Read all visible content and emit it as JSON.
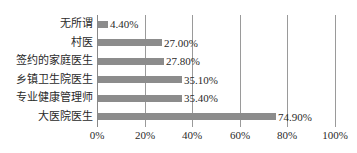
{
  "chart_data": {
    "type": "bar",
    "orientation": "horizontal",
    "title": "",
    "xlabel": "",
    "ylabel": "",
    "categories": [
      "无所谓",
      "村医",
      "签约的家庭医生",
      "乡镇卫生院医生",
      "专业健康管理师",
      "大医院医生"
    ],
    "values": [
      4.4,
      27.0,
      27.8,
      35.1,
      35.4,
      74.9
    ],
    "value_labels": [
      "4.40%",
      "27.00%",
      "27.80%",
      "35.10%",
      "35.40%",
      "74.90%"
    ],
    "xlim": [
      0,
      100
    ],
    "x_ticks": [
      "0%",
      "20%",
      "40%",
      "60%",
      "80%",
      "100%"
    ],
    "grid": true,
    "legend": null,
    "bar_color": "#8c8c8c"
  }
}
